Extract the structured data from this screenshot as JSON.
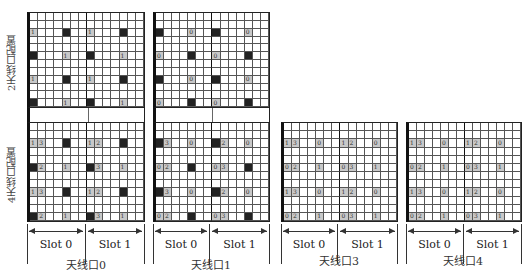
{
  "row_labels": {
    "two_antenna": "2天线口配置",
    "four_antenna": "4天线口配置"
  },
  "slot_labels": [
    "Slot 0",
    "Slot 1"
  ],
  "grid": {
    "columns": 14,
    "rows": 12,
    "symbols_per_slot": 7
  },
  "panels": [
    {
      "caption": "天线口0",
      "two_antenna": [
        {
          "row": 2,
          "col": 0,
          "type": "ref",
          "label": "1"
        },
        {
          "row": 2,
          "col": 4,
          "type": "blk",
          "label": "0"
        },
        {
          "row": 2,
          "col": 7,
          "type": "ref",
          "label": "1"
        },
        {
          "row": 2,
          "col": 11,
          "type": "blk",
          "label": "0"
        },
        {
          "row": 5,
          "col": 0,
          "type": "blk",
          "label": "1"
        },
        {
          "row": 5,
          "col": 4,
          "type": "ref",
          "label": "1"
        },
        {
          "row": 5,
          "col": 7,
          "type": "blk",
          "label": "0"
        },
        {
          "row": 5,
          "col": 11,
          "type": "ref",
          "label": "1"
        },
        {
          "row": 8,
          "col": 0,
          "type": "ref",
          "label": "1"
        },
        {
          "row": 8,
          "col": 4,
          "type": "blk",
          "label": "0"
        },
        {
          "row": 8,
          "col": 7,
          "type": "ref",
          "label": "1"
        },
        {
          "row": 8,
          "col": 11,
          "type": "blk",
          "label": "0"
        },
        {
          "row": 11,
          "col": 0,
          "type": "blk",
          "label": "0"
        },
        {
          "row": 11,
          "col": 4,
          "type": "ref",
          "label": "1"
        },
        {
          "row": 11,
          "col": 7,
          "type": "blk",
          "label": "0"
        },
        {
          "row": 11,
          "col": 11,
          "type": "ref",
          "label": "1"
        }
      ],
      "four_antenna": [
        {
          "row": 2,
          "col": 0,
          "type": "ref",
          "label": "1"
        },
        {
          "row": 2,
          "col": 1,
          "type": "ref",
          "label": "3"
        },
        {
          "row": 2,
          "col": 4,
          "type": "blk",
          "label": "0"
        },
        {
          "row": 2,
          "col": 7,
          "type": "ref",
          "label": "1"
        },
        {
          "row": 2,
          "col": 8,
          "type": "ref",
          "label": "2"
        },
        {
          "row": 2,
          "col": 11,
          "type": "blk",
          "label": "0"
        },
        {
          "row": 5,
          "col": 0,
          "type": "blk",
          "label": "0"
        },
        {
          "row": 5,
          "col": 1,
          "type": "ref",
          "label": "2"
        },
        {
          "row": 5,
          "col": 4,
          "type": "ref",
          "label": "1"
        },
        {
          "row": 5,
          "col": 7,
          "type": "blk",
          "label": "0"
        },
        {
          "row": 5,
          "col": 8,
          "type": "ref",
          "label": "3"
        },
        {
          "row": 5,
          "col": 11,
          "type": "ref",
          "label": "1"
        },
        {
          "row": 8,
          "col": 0,
          "type": "ref",
          "label": "1"
        },
        {
          "row": 8,
          "col": 1,
          "type": "ref",
          "label": "3"
        },
        {
          "row": 8,
          "col": 4,
          "type": "blk",
          "label": "0"
        },
        {
          "row": 8,
          "col": 7,
          "type": "ref",
          "label": "1"
        },
        {
          "row": 8,
          "col": 8,
          "type": "ref",
          "label": "2"
        },
        {
          "row": 8,
          "col": 11,
          "type": "blk",
          "label": "0"
        },
        {
          "row": 11,
          "col": 0,
          "type": "blk",
          "label": "0"
        },
        {
          "row": 11,
          "col": 1,
          "type": "ref",
          "label": "2"
        },
        {
          "row": 11,
          "col": 4,
          "type": "ref",
          "label": "1"
        },
        {
          "row": 11,
          "col": 7,
          "type": "blk",
          "label": "0"
        },
        {
          "row": 11,
          "col": 8,
          "type": "ref",
          "label": "3"
        },
        {
          "row": 11,
          "col": 11,
          "type": "ref",
          "label": "1"
        }
      ]
    },
    {
      "caption": "天线口1",
      "two_antenna": [
        {
          "row": 2,
          "col": 0,
          "type": "blk",
          "label": "1"
        },
        {
          "row": 2,
          "col": 4,
          "type": "ref",
          "label": "0"
        },
        {
          "row": 2,
          "col": 7,
          "type": "blk",
          "label": "1"
        },
        {
          "row": 2,
          "col": 11,
          "type": "ref",
          "label": "0"
        },
        {
          "row": 5,
          "col": 0,
          "type": "ref",
          "label": "0"
        },
        {
          "row": 5,
          "col": 4,
          "type": "blk",
          "label": "1"
        },
        {
          "row": 5,
          "col": 7,
          "type": "ref",
          "label": "0"
        },
        {
          "row": 5,
          "col": 11,
          "type": "blk",
          "label": "1"
        },
        {
          "row": 8,
          "col": 0,
          "type": "blk",
          "label": "1"
        },
        {
          "row": 8,
          "col": 4,
          "type": "ref",
          "label": "0"
        },
        {
          "row": 8,
          "col": 7,
          "type": "blk",
          "label": "1"
        },
        {
          "row": 8,
          "col": 11,
          "type": "ref",
          "label": "0"
        },
        {
          "row": 11,
          "col": 0,
          "type": "ref",
          "label": "0"
        },
        {
          "row": 11,
          "col": 4,
          "type": "blk",
          "label": "1"
        },
        {
          "row": 11,
          "col": 7,
          "type": "ref",
          "label": "0"
        },
        {
          "row": 11,
          "col": 11,
          "type": "blk",
          "label": "1"
        }
      ],
      "four_antenna": [
        {
          "row": 2,
          "col": 0,
          "type": "blk",
          "label": "1"
        },
        {
          "row": 2,
          "col": 1,
          "type": "ref",
          "label": "3"
        },
        {
          "row": 2,
          "col": 4,
          "type": "ref",
          "label": "0"
        },
        {
          "row": 2,
          "col": 7,
          "type": "blk",
          "label": "1"
        },
        {
          "row": 2,
          "col": 8,
          "type": "ref",
          "label": "2"
        },
        {
          "row": 2,
          "col": 11,
          "type": "ref",
          "label": "0"
        },
        {
          "row": 5,
          "col": 0,
          "type": "ref",
          "label": "0"
        },
        {
          "row": 5,
          "col": 1,
          "type": "ref",
          "label": "2"
        },
        {
          "row": 5,
          "col": 4,
          "type": "blk",
          "label": "1"
        },
        {
          "row": 5,
          "col": 7,
          "type": "ref",
          "label": "0"
        },
        {
          "row": 5,
          "col": 8,
          "type": "ref",
          "label": "3"
        },
        {
          "row": 5,
          "col": 11,
          "type": "blk",
          "label": "1"
        },
        {
          "row": 8,
          "col": 0,
          "type": "blk",
          "label": "1"
        },
        {
          "row": 8,
          "col": 1,
          "type": "ref",
          "label": "3"
        },
        {
          "row": 8,
          "col": 4,
          "type": "ref",
          "label": "0"
        },
        {
          "row": 8,
          "col": 7,
          "type": "blk",
          "label": "1"
        },
        {
          "row": 8,
          "col": 8,
          "type": "ref",
          "label": "2"
        },
        {
          "row": 8,
          "col": 11,
          "type": "ref",
          "label": "0"
        },
        {
          "row": 11,
          "col": 0,
          "type": "ref",
          "label": "0"
        },
        {
          "row": 11,
          "col": 1,
          "type": "ref",
          "label": "2"
        },
        {
          "row": 11,
          "col": 4,
          "type": "blk",
          "label": "1"
        },
        {
          "row": 11,
          "col": 7,
          "type": "ref",
          "label": "0"
        },
        {
          "row": 11,
          "col": 8,
          "type": "ref",
          "label": "3"
        },
        {
          "row": 11,
          "col": 11,
          "type": "blk",
          "label": "1"
        }
      ]
    },
    {
      "caption": "天线口3",
      "four_antenna": [
        {
          "row": 2,
          "col": 0,
          "type": "ref",
          "label": "1"
        },
        {
          "row": 2,
          "col": 1,
          "type": "ref",
          "label": "3"
        },
        {
          "row": 2,
          "col": 4,
          "type": "ref",
          "label": "0"
        },
        {
          "row": 2,
          "col": 7,
          "type": "ref",
          "label": "1"
        },
        {
          "row": 2,
          "col": 8,
          "type": "ref",
          "label": "2"
        },
        {
          "row": 2,
          "col": 11,
          "type": "ref",
          "label": "0"
        },
        {
          "row": 5,
          "col": 0,
          "type": "ref",
          "label": "0"
        },
        {
          "row": 5,
          "col": 1,
          "type": "ref",
          "label": "2"
        },
        {
          "row": 5,
          "col": 4,
          "type": "ref",
          "label": "1"
        },
        {
          "row": 5,
          "col": 7,
          "type": "ref",
          "label": "0"
        },
        {
          "row": 5,
          "col": 8,
          "type": "ref",
          "label": "3"
        },
        {
          "row": 5,
          "col": 11,
          "type": "ref",
          "label": "1"
        },
        {
          "row": 8,
          "col": 0,
          "type": "ref",
          "label": "1"
        },
        {
          "row": 8,
          "col": 1,
          "type": "ref",
          "label": "3"
        },
        {
          "row": 8,
          "col": 4,
          "type": "ref",
          "label": "0"
        },
        {
          "row": 8,
          "col": 7,
          "type": "ref",
          "label": "1"
        },
        {
          "row": 8,
          "col": 8,
          "type": "ref",
          "label": "2"
        },
        {
          "row": 8,
          "col": 11,
          "type": "ref",
          "label": "0"
        },
        {
          "row": 11,
          "col": 0,
          "type": "ref",
          "label": "0"
        },
        {
          "row": 11,
          "col": 1,
          "type": "ref",
          "label": "2"
        },
        {
          "row": 11,
          "col": 4,
          "type": "ref",
          "label": "1"
        },
        {
          "row": 11,
          "col": 7,
          "type": "ref",
          "label": "0"
        },
        {
          "row": 11,
          "col": 8,
          "type": "ref",
          "label": "3"
        },
        {
          "row": 11,
          "col": 11,
          "type": "ref",
          "label": "1"
        }
      ]
    },
    {
      "caption": "天线口4",
      "four_antenna": [
        {
          "row": 2,
          "col": 0,
          "type": "ref",
          "label": "1"
        },
        {
          "row": 2,
          "col": 1,
          "type": "ref",
          "label": "3"
        },
        {
          "row": 2,
          "col": 4,
          "type": "ref",
          "label": "0"
        },
        {
          "row": 2,
          "col": 7,
          "type": "ref",
          "label": "1"
        },
        {
          "row": 2,
          "col": 8,
          "type": "ref",
          "label": "2"
        },
        {
          "row": 2,
          "col": 11,
          "type": "ref",
          "label": "0"
        },
        {
          "row": 5,
          "col": 0,
          "type": "ref",
          "label": "0"
        },
        {
          "row": 5,
          "col": 1,
          "type": "ref",
          "label": "2"
        },
        {
          "row": 5,
          "col": 4,
          "type": "ref",
          "label": "1"
        },
        {
          "row": 5,
          "col": 7,
          "type": "ref",
          "label": "0"
        },
        {
          "row": 5,
          "col": 8,
          "type": "ref",
          "label": "3"
        },
        {
          "row": 5,
          "col": 11,
          "type": "ref",
          "label": "1"
        },
        {
          "row": 8,
          "col": 0,
          "type": "ref",
          "label": "1"
        },
        {
          "row": 8,
          "col": 1,
          "type": "ref",
          "label": "3"
        },
        {
          "row": 8,
          "col": 4,
          "type": "ref",
          "label": "0"
        },
        {
          "row": 8,
          "col": 7,
          "type": "ref",
          "label": "1"
        },
        {
          "row": 8,
          "col": 8,
          "type": "ref",
          "label": "2"
        },
        {
          "row": 8,
          "col": 11,
          "type": "ref",
          "label": "0"
        },
        {
          "row": 11,
          "col": 0,
          "type": "ref",
          "label": "0"
        },
        {
          "row": 11,
          "col": 1,
          "type": "ref",
          "label": "2"
        },
        {
          "row": 11,
          "col": 4,
          "type": "ref",
          "label": "1"
        },
        {
          "row": 11,
          "col": 7,
          "type": "ref",
          "label": "0"
        },
        {
          "row": 11,
          "col": 8,
          "type": "ref",
          "label": "3"
        },
        {
          "row": 11,
          "col": 11,
          "type": "ref",
          "label": "1"
        }
      ]
    }
  ]
}
